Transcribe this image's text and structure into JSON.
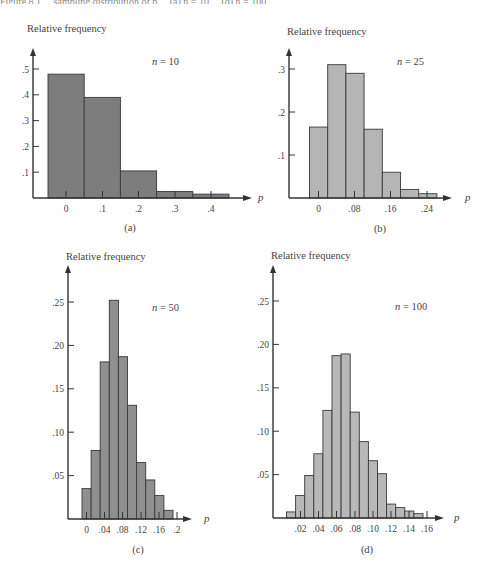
{
  "page": {
    "top_caption_fragment": "Figure 8.1 ... sampling distribution of p ... (a) n = 10 ... (d) n = 100"
  },
  "chart_data": [
    {
      "id": "a",
      "type": "bar",
      "subtitle": "(a)",
      "annotation": "n = 10",
      "n": 10,
      "ylabel": "Relative frequency",
      "xlabel": "p",
      "categories": [
        "0",
        ".1",
        ".2",
        ".3",
        ".4"
      ],
      "x_ticks": [
        "0",
        ".1",
        ".2",
        ".3",
        ".4"
      ],
      "y_ticks": [
        ".1",
        ".2",
        ".3",
        ".4",
        ".5"
      ],
      "y_tick_values": [
        0.1,
        0.2,
        0.3,
        0.4,
        0.5
      ],
      "values": [
        0.48,
        0.39,
        0.105,
        0.025,
        0.015
      ],
      "ylim": [
        0,
        0.55
      ],
      "bar_color": "#7d7d7d",
      "grid": false
    },
    {
      "id": "b",
      "type": "bar",
      "subtitle": "(b)",
      "annotation": "n = 25",
      "n": 25,
      "ylabel": "Relative frequency",
      "xlabel": "p",
      "categories": [
        "0",
        ".04",
        ".08",
        ".12",
        ".16",
        ".20",
        ".24"
      ],
      "x_ticks": [
        "0",
        ".08",
        ".16",
        ".24"
      ],
      "y_ticks": [
        ".1",
        ".2",
        ".3"
      ],
      "y_tick_values": [
        0.1,
        0.2,
        0.3
      ],
      "values": [
        0.165,
        0.31,
        0.29,
        0.16,
        0.06,
        0.02,
        0.01
      ],
      "ylim": [
        0,
        0.35
      ],
      "bar_color": "#b5b5b5",
      "grid": false
    },
    {
      "id": "c",
      "type": "bar",
      "subtitle": "(c)",
      "annotation": "n = 50",
      "n": 50,
      "ylabel": "Relative frequency",
      "xlabel": "p",
      "categories": [
        "0",
        ".02",
        ".04",
        ".06",
        ".08",
        ".10",
        ".12",
        ".14",
        ".16",
        ".18"
      ],
      "x_ticks": [
        "0",
        ".04",
        ".08",
        ".12",
        ".16",
        ".2"
      ],
      "y_ticks": [
        ".05",
        ".10",
        ".15",
        ".20",
        ".25"
      ],
      "y_tick_values": [
        0.05,
        0.1,
        0.15,
        0.2,
        0.25
      ],
      "values": [
        0.035,
        0.079,
        0.181,
        0.252,
        0.187,
        0.131,
        0.065,
        0.045,
        0.027,
        0.01
      ],
      "ylim": [
        0,
        0.28
      ],
      "bar_color": "#8f8f8f",
      "grid": false
    },
    {
      "id": "d",
      "type": "bar",
      "subtitle": "(d)",
      "annotation": "n = 100",
      "n": 100,
      "ylabel": "Relative frequency",
      "xlabel": "p",
      "categories": [
        "0",
        ".01",
        ".02",
        ".03",
        ".04",
        ".05",
        ".06",
        ".07",
        ".08",
        ".09",
        ".10",
        ".11",
        ".12",
        ".13",
        ".14"
      ],
      "x_ticks": [
        ".02",
        ".04",
        ".06",
        ".08",
        ".10",
        ".12",
        ".14",
        ".16"
      ],
      "y_ticks": [
        ".05",
        ".10",
        ".15",
        ".20",
        ".25"
      ],
      "y_tick_values": [
        0.05,
        0.1,
        0.15,
        0.2,
        0.25
      ],
      "values": [
        0.007,
        0.026,
        0.049,
        0.074,
        0.124,
        0.187,
        0.189,
        0.122,
        0.088,
        0.066,
        0.051,
        0.016,
        0.012,
        0.008,
        0.005
      ],
      "ylim": [
        0,
        0.28
      ],
      "bar_color": "#b8b8b8",
      "grid": false
    }
  ]
}
